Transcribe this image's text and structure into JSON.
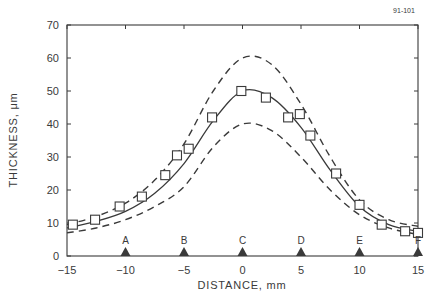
{
  "figure_id": "91-101",
  "chart_data": {
    "type": "scatter",
    "title": "",
    "xlabel": "DISTANCE, mm",
    "ylabel": "THICKNESS, μm",
    "xlim": [
      -15,
      15
    ],
    "ylim": [
      0,
      70
    ],
    "xticks": [
      -15,
      -10,
      -5,
      0,
      5,
      10,
      15
    ],
    "xtick_labels": [
      "−15",
      "−10",
      "−5",
      "0",
      "5",
      "10",
      "15"
    ],
    "yticks": [
      0,
      10,
      20,
      30,
      40,
      50,
      60,
      70
    ],
    "ytick_labels": [
      "0",
      "10",
      "20",
      "30",
      "40",
      "50",
      "60",
      "70"
    ],
    "grid": false,
    "legend": null,
    "series": [
      {
        "name": "measured",
        "style": "open-square-markers",
        "x": [
          -14.5,
          -12.6,
          -10.5,
          -8.6,
          -6.6,
          -5.6,
          -4.6,
          -2.6,
          -0.1,
          2.0,
          3.9,
          4.9,
          5.8,
          8.0,
          10.0,
          11.9,
          13.9,
          15.0
        ],
        "y": [
          9.5,
          11,
          15,
          18,
          24.5,
          30.5,
          32.5,
          42,
          50,
          48,
          42,
          43,
          36.5,
          25,
          15.5,
          9.5,
          7.5,
          7
        ]
      },
      {
        "name": "fit",
        "style": "solid-line",
        "x": [
          -15,
          -12.5,
          -10,
          -7.5,
          -5,
          -2.5,
          0,
          2.5,
          5,
          7.5,
          10,
          12.5,
          15
        ],
        "y": [
          8.5,
          10.5,
          13.5,
          19,
          28,
          41,
          50,
          48,
          39,
          26,
          15,
          9.5,
          7.5
        ]
      },
      {
        "name": "upper-bound",
        "style": "dashed-line",
        "x": [
          -15,
          -12.5,
          -10,
          -7.5,
          -5,
          -2.5,
          0,
          2.5,
          5,
          7.5,
          10,
          12.5,
          15
        ],
        "y": [
          9.5,
          12,
          16,
          23,
          34,
          50,
          60,
          58,
          46,
          30,
          17,
          11,
          9
        ]
      },
      {
        "name": "lower-bound",
        "style": "dashed-line",
        "x": [
          -15,
          -12.5,
          -10,
          -7.5,
          -5,
          -2.5,
          0,
          2.5,
          5,
          7.5,
          10,
          12.5,
          15
        ],
        "y": [
          7,
          8.5,
          11,
          15,
          21,
          33,
          40,
          38,
          30,
          20,
          12.5,
          8.5,
          6.5
        ]
      }
    ],
    "annotations": [
      {
        "label": "A",
        "x": -10,
        "marker": "filled-triangle"
      },
      {
        "label": "B",
        "x": -5,
        "marker": "filled-triangle"
      },
      {
        "label": "C",
        "x": 0,
        "marker": "filled-triangle"
      },
      {
        "label": "D",
        "x": 5,
        "marker": "filled-triangle"
      },
      {
        "label": "E",
        "x": 10,
        "marker": "filled-triangle"
      },
      {
        "label": "F",
        "x": 15,
        "marker": "filled-triangle"
      }
    ],
    "colors": {
      "ink": "#3a3a3a",
      "background": "#ffffff"
    }
  }
}
